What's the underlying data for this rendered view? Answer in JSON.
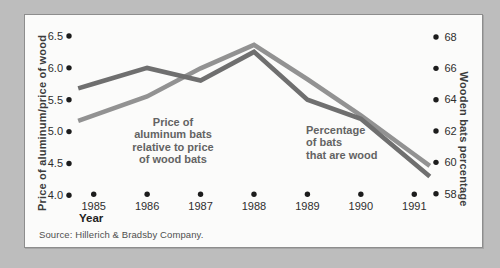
{
  "window": {
    "background": "#bdbdbd",
    "panel_background": "#fbfbfa",
    "panel_border": "#8d8d8d"
  },
  "chart_data": {
    "type": "line",
    "x": [
      1985,
      1986,
      1987,
      1988,
      1989,
      1990,
      1991
    ],
    "x_label": "Year",
    "series": [
      {
        "name": "Price of aluminum bats relative to price of wood bats",
        "axis": "left",
        "color": "#6f6f6f",
        "values": [
          5.75,
          6.0,
          5.8,
          6.25,
          5.5,
          5.2,
          4.5
        ]
      },
      {
        "name": "Percentage of bats that are wood",
        "axis": "right",
        "color": "#929292",
        "values": [
          63,
          64.2,
          66,
          67.5,
          65.3,
          63,
          60.5
        ]
      }
    ],
    "left_axis": {
      "label": "Price of aluminum/price of wood",
      "ticks": [
        6.5,
        6.0,
        5.5,
        5.0,
        4.5,
        4.0
      ],
      "range": [
        4.0,
        6.5
      ]
    },
    "right_axis": {
      "label": "Wooden bats percentage",
      "ticks": [
        68,
        66,
        64,
        62,
        60,
        58
      ],
      "range": [
        58,
        68
      ]
    },
    "grid": false,
    "tick_marker": "dot",
    "legend": "none",
    "annotations": [
      {
        "id": "price",
        "text": "Price of\naluminum bats\nrelative to price\nof wood bats"
      },
      {
        "id": "pct",
        "text": "Percentage\nof bats\nthat are wood"
      }
    ],
    "source": "Source: Hillerich & Bradsby Company."
  },
  "colors": {
    "tick_dot": "#1c1c1c",
    "tick_text": "#2e2e2e",
    "annotation_text": "#636363",
    "axis_title_text": "#3c3c3c",
    "source_text": "#4f4f4f"
  }
}
